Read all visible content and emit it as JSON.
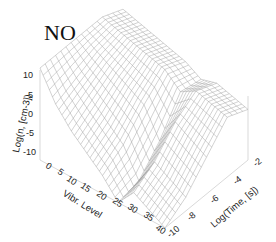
{
  "chart_data": {
    "type": "surface3d",
    "title": "NO",
    "xlabel": "Vibr. Level",
    "ylabel": "Log(Time, [s])",
    "zlabel": "Log(n, [cm-3])",
    "x_ticks": [
      "0",
      "5",
      "10",
      "15",
      "20",
      "25",
      "30",
      "35",
      "40"
    ],
    "y_ticks": [
      "-10",
      "-8",
      "-6",
      "-4",
      "-2"
    ],
    "z_ticks": [
      "-10",
      "-5",
      "0",
      "5",
      "10"
    ],
    "xlim": [
      0,
      40
    ],
    "ylim": [
      -10,
      -2
    ],
    "zlim": [
      -10,
      10
    ],
    "grid": false,
    "style": "wireframe",
    "series": [
      {
        "name": "Log(n) at Log(Time)=-10",
        "x": [
          0,
          5,
          10,
          15,
          20,
          25,
          30,
          35,
          40
        ],
        "values": [
          10,
          4,
          0,
          -3,
          -6,
          -10,
          -6,
          -8,
          -10
        ]
      },
      {
        "name": "Log(n) at Log(Time)=-8",
        "x": [
          0,
          5,
          10,
          15,
          20,
          25,
          30,
          35,
          40
        ],
        "values": [
          10,
          6,
          3,
          0,
          -3,
          -9,
          -3,
          -5,
          -7
        ]
      },
      {
        "name": "Log(n) at Log(Time)=-6",
        "x": [
          0,
          5,
          10,
          15,
          20,
          25,
          30,
          35,
          40
        ],
        "values": [
          10,
          8,
          6,
          4,
          2,
          -4,
          2,
          0,
          -2
        ]
      },
      {
        "name": "Log(n) at Log(Time)=-4",
        "x": [
          0,
          5,
          10,
          15,
          20,
          25,
          30,
          35,
          40
        ],
        "values": [
          10,
          9,
          8,
          7,
          6,
          3,
          5,
          4,
          3
        ]
      },
      {
        "name": "Log(n) at Log(Time)=-2",
        "x": [
          0,
          5,
          10,
          15,
          20,
          25,
          30,
          35,
          40
        ],
        "values": [
          8,
          7,
          6,
          5,
          4,
          2,
          3,
          2,
          1
        ]
      }
    ]
  },
  "labels": {
    "title": "NO",
    "xlabel": "Vibr. Level",
    "ylabel": "Log(Time, [s])",
    "zlabel": "Log(n, [cm-3])"
  },
  "ticks": {
    "x": [
      "0",
      "5",
      "10",
      "15",
      "20",
      "25",
      "30",
      "35",
      "40"
    ],
    "y": [
      "-10",
      "-8",
      "-6",
      "-4",
      "-2"
    ],
    "z": [
      "10",
      "5",
      "0",
      "-5",
      "-10"
    ]
  }
}
